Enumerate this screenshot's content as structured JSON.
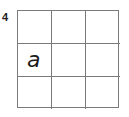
{
  "problem_number": "4",
  "grid": {
    "rows": 3,
    "cols": 3,
    "cells": [
      [
        "",
        "",
        ""
      ],
      [
        "a",
        "",
        ""
      ],
      [
        "",
        "",
        ""
      ]
    ]
  }
}
